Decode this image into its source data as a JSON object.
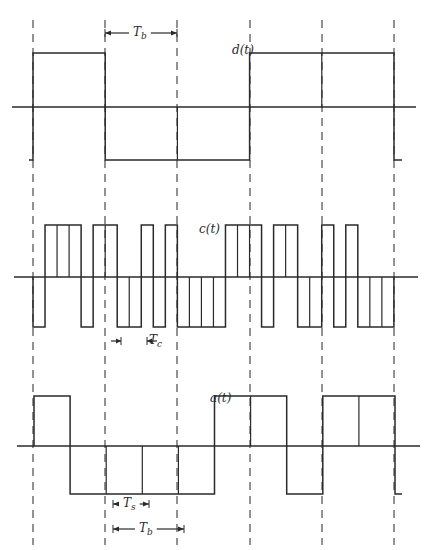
{
  "figure": {
    "width": 432,
    "height": 550,
    "line_color": "#2a2a2a",
    "dash_color": "#3a3a3a",
    "dashed_guides_x": [
      33,
      105,
      177,
      250,
      322,
      394
    ],
    "dashed_y_range": [
      20,
      545
    ],
    "bit_period_px": 72.2,
    "chips_per_bit": 6,
    "symbols_per_bit": 2
  },
  "signals": [
    {
      "id": "d",
      "label": "d(t)",
      "label_pos": [
        232,
        44
      ],
      "axis_y": 107,
      "axis_x_range": [
        12,
        416
      ],
      "high_y": 53,
      "low_y": 160,
      "start_x": 33,
      "unit_px": 72.2,
      "pre_stub": [
        29,
        33
      ],
      "post_stub": [
        394,
        402
      ],
      "values": [
        1,
        -1,
        -1,
        1,
        1
      ]
    },
    {
      "id": "c",
      "label": "c(t)",
      "label_pos": [
        199,
        223
      ],
      "axis_y": 277,
      "axis_x_range": [
        14,
        418
      ],
      "high_y": 225,
      "low_y": 327,
      "start_x": 33,
      "unit_px": 12.03,
      "pre_stub": null,
      "post_stub": null,
      "values": [
        -1,
        1,
        1,
        1,
        -1,
        1,
        1,
        -1,
        -1,
        1,
        -1,
        1,
        -1,
        -1,
        -1,
        -1,
        1,
        1,
        1,
        -1,
        1,
        1,
        -1,
        -1,
        1,
        -1,
        1,
        -1,
        -1,
        -1
      ]
    },
    {
      "id": "a",
      "label": "a(t)",
      "label_pos": [
        210,
        392
      ],
      "axis_y": 446,
      "axis_x_range": [
        17,
        420
      ],
      "high_y": 396,
      "low_y": 494,
      "start_x": 34,
      "unit_px": 36.1,
      "pre_stub": null,
      "post_stub": [
        394,
        402
      ],
      "values": [
        1,
        -1,
        -1,
        -1,
        -1,
        1,
        1,
        -1,
        1,
        1
      ]
    }
  ],
  "annotations": [
    {
      "id": "Tb-top",
      "label": "T",
      "sub": "b",
      "x1": 105,
      "x2": 177,
      "y": 33,
      "label_x": 133,
      "label_y": 26
    },
    {
      "id": "Tc",
      "label": "T",
      "sub": "c",
      "x1": 121,
      "x2": 147,
      "y": 341,
      "label_x": 149,
      "label_y": 334,
      "outside": true
    },
    {
      "id": "Ts",
      "label": "T",
      "sub": "s",
      "x1": 113,
      "x2": 149,
      "y": 504,
      "label_x": 123,
      "label_y": 497
    },
    {
      "id": "Tb-bottom",
      "label": "T",
      "sub": "b",
      "x1": 113,
      "x2": 184,
      "y": 529,
      "label_x": 139,
      "label_y": 522
    }
  ]
}
